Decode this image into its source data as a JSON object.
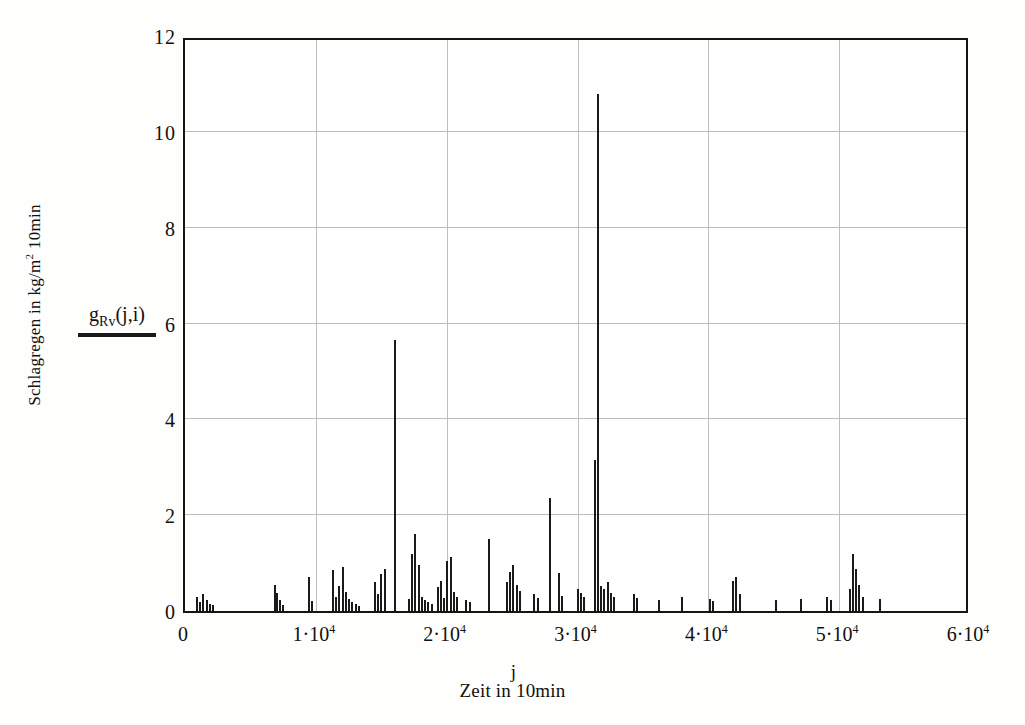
{
  "chart_data": {
    "type": "bar",
    "title": "",
    "subtitle": "",
    "xlabel": "Zeit in 10min",
    "x_symbol": "j",
    "ylabel": "Schlagregen in kg/m² 10min",
    "y_symbol": "g",
    "y_symbol_sub": "Rv",
    "y_symbol_args": "(j,i)",
    "legend_label": "g",
    "legend_sub": "Rv",
    "legend_args": "(j,i)",
    "legend_position": "left-of-axis",
    "grid": true,
    "xlim": [
      0,
      60000
    ],
    "ylim": [
      0,
      12
    ],
    "xticks": [
      0,
      10000,
      20000,
      30000,
      40000,
      50000,
      60000
    ],
    "xtick_labels": [
      "0",
      "1·10",
      "2·10",
      "3·10",
      "4·10",
      "5·10",
      "6·10"
    ],
    "xtick_exponents": [
      "",
      "4",
      "4",
      "4",
      "4",
      "4",
      "4"
    ],
    "yticks": [
      0,
      2,
      4,
      6,
      8,
      10,
      12
    ],
    "ytick_labels": [
      "0",
      "2",
      "4",
      "6",
      "8",
      "10",
      "12"
    ],
    "series_name": "g_Rv(j,i)",
    "bar_color": "#1a1a1a",
    "grid_color": "#bdbdbd",
    "axis_color": "#17150f",
    "x": [
      900,
      1150,
      1400,
      1650,
      1900,
      2150,
      6850,
      7050,
      7250,
      7500,
      9450,
      9700,
      11300,
      11550,
      11800,
      12050,
      12300,
      12550,
      12800,
      13050,
      13300,
      14500,
      14750,
      15000,
      15250,
      16050,
      17100,
      17350,
      17600,
      17850,
      18100,
      18350,
      18600,
      18850,
      19300,
      19550,
      19800,
      20050,
      20300,
      20550,
      20800,
      21500,
      21750,
      23200,
      24600,
      24850,
      25100,
      25350,
      25600,
      26700,
      26950,
      27900,
      28600,
      28850,
      30000,
      30250,
      30500,
      31300,
      31550,
      31800,
      32050,
      32300,
      32550,
      32800,
      34300,
      34550,
      36200,
      38000,
      40100,
      40350,
      41900,
      42150,
      42400,
      45200,
      47100,
      49100,
      49350,
      50800,
      51050,
      51300,
      51550,
      51800,
      53100
    ],
    "values": [
      0.3,
      0.18,
      0.35,
      0.22,
      0.14,
      0.12,
      0.55,
      0.38,
      0.22,
      0.13,
      0.72,
      0.2,
      0.85,
      0.3,
      0.52,
      0.92,
      0.4,
      0.26,
      0.18,
      0.14,
      0.1,
      0.6,
      0.35,
      0.78,
      0.88,
      5.65,
      0.25,
      1.18,
      1.6,
      0.95,
      0.3,
      0.22,
      0.18,
      0.15,
      0.5,
      0.62,
      0.28,
      1.05,
      1.12,
      0.4,
      0.3,
      0.22,
      0.18,
      1.5,
      0.6,
      0.82,
      0.95,
      0.55,
      0.42,
      0.35,
      0.28,
      2.36,
      0.8,
      0.32,
      0.45,
      0.38,
      0.3,
      3.15,
      10.8,
      0.52,
      0.45,
      0.6,
      0.38,
      0.3,
      0.35,
      0.28,
      0.22,
      0.3,
      0.25,
      0.2,
      0.62,
      0.7,
      0.35,
      0.22,
      0.25,
      0.3,
      0.22,
      0.45,
      1.18,
      0.88,
      0.55,
      0.3,
      0.25
    ],
    "notes": {
      "max_value": 10.8,
      "max_value_x": 31550,
      "second_peak": 5.65,
      "second_peak_x": 16050,
      "data_end_x": 53200
    }
  }
}
